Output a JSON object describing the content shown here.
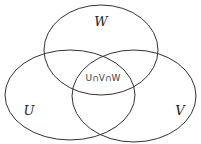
{
  "diagram": {
    "type": "venn",
    "sets": [
      {
        "id": "W",
        "label": "W"
      },
      {
        "id": "U",
        "label": "U"
      },
      {
        "id": "V",
        "label": "V"
      }
    ],
    "intersection_label": "U∩V∩W",
    "colors": {
      "stroke": "#333333",
      "background": "#ffffff",
      "text": "#222222"
    }
  }
}
